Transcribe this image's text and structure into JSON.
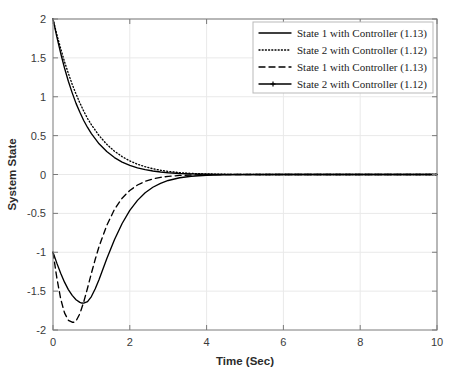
{
  "chart_data": {
    "type": "line",
    "title": "",
    "xlabel": "Time (Sec)",
    "ylabel": "System State",
    "xlim": [
      0,
      10
    ],
    "ylim": [
      -2,
      2
    ],
    "xticks": [
      0,
      2,
      4,
      6,
      8,
      10
    ],
    "xtick_labels": [
      "0",
      "2",
      "4",
      "6",
      "8",
      "10"
    ],
    "yticks": [
      -2,
      -1.5,
      -1,
      -0.5,
      0,
      0.5,
      1,
      1.5,
      2
    ],
    "ytick_labels": [
      "-2",
      "-1.5",
      "-1",
      "-0.5",
      "0",
      "0.5",
      "1",
      "1.5",
      "2"
    ],
    "grid": true,
    "legend_position": "top-right",
    "series": [
      {
        "name": "State 1 with Controller (1.13)",
        "style": "solid",
        "color": "#000000",
        "x": [
          0,
          0.1,
          0.2,
          0.3,
          0.4,
          0.5,
          0.6,
          0.7,
          0.8,
          0.9,
          1.0,
          1.2,
          1.4,
          1.6,
          1.8,
          2.0,
          2.2,
          2.4,
          2.6,
          2.8,
          3.0,
          3.3,
          3.6,
          4.0,
          4.5,
          5.0,
          6.0,
          7.0,
          8.0,
          9.0,
          10.0
        ],
        "values": [
          2.0,
          1.77,
          1.56,
          1.37,
          1.2,
          1.05,
          0.915,
          0.8,
          0.695,
          0.605,
          0.525,
          0.395,
          0.295,
          0.218,
          0.16,
          0.118,
          0.086,
          0.062,
          0.045,
          0.032,
          0.023,
          0.013,
          0.0075,
          0.0035,
          0.0012,
          0.0004,
          0.0,
          0.0,
          0.0,
          0.0,
          0.0
        ]
      },
      {
        "name": "State 2 with Controller (1.12)",
        "style": "dotted",
        "color": "#000000",
        "x": [
          0,
          0.1,
          0.2,
          0.3,
          0.4,
          0.5,
          0.6,
          0.7,
          0.8,
          0.9,
          1.0,
          1.2,
          1.4,
          1.6,
          1.8,
          2.0,
          2.2,
          2.4,
          2.6,
          2.8,
          3.0,
          3.3,
          3.6,
          4.0,
          4.5,
          5.0,
          6.0,
          7.0,
          8.0,
          9.0,
          10.0
        ],
        "values": [
          2.0,
          1.8,
          1.62,
          1.45,
          1.3,
          1.16,
          1.035,
          0.92,
          0.815,
          0.72,
          0.64,
          0.5,
          0.388,
          0.3,
          0.23,
          0.175,
          0.132,
          0.1,
          0.074,
          0.055,
          0.04,
          0.024,
          0.014,
          0.007,
          0.0025,
          0.0009,
          0.0001,
          0.0,
          0.0,
          0.0,
          0.0
        ]
      },
      {
        "name": "State 1 with Controller (1.13)",
        "style": "dashed",
        "color": "#000000",
        "x": [
          0,
          0.1,
          0.2,
          0.3,
          0.4,
          0.5,
          0.55,
          0.6,
          0.7,
          0.8,
          0.9,
          1.0,
          1.1,
          1.2,
          1.4,
          1.6,
          1.8,
          2.0,
          2.2,
          2.4,
          2.6,
          2.8,
          3.0,
          3.3,
          3.6,
          4.0,
          4.5,
          5.0,
          6.0,
          7.0,
          8.0,
          9.0,
          10.0
        ],
        "values": [
          -1.0,
          -1.33,
          -1.6,
          -1.78,
          -1.875,
          -1.9,
          -1.9,
          -1.885,
          -1.79,
          -1.64,
          -1.46,
          -1.27,
          -1.09,
          -0.925,
          -0.655,
          -0.45,
          -0.305,
          -0.205,
          -0.135,
          -0.088,
          -0.057,
          -0.037,
          -0.024,
          -0.012,
          -0.006,
          -0.0025,
          -0.0008,
          -0.0002,
          0.0,
          0.0,
          0.0,
          0.0,
          0.0
        ]
      },
      {
        "name": "State 2 with Controller (1.12)",
        "style": "solid-marker",
        "color": "#000000",
        "x": [
          0,
          0.1,
          0.2,
          0.3,
          0.4,
          0.5,
          0.6,
          0.7,
          0.75,
          0.8,
          0.9,
          1.0,
          1.1,
          1.2,
          1.4,
          1.6,
          1.8,
          2.0,
          2.2,
          2.4,
          2.6,
          2.8,
          3.0,
          3.3,
          3.6,
          4.0,
          4.5,
          5.0,
          6.0,
          7.0,
          8.0,
          9.0,
          10.0
        ],
        "values": [
          -1.0,
          -1.14,
          -1.27,
          -1.385,
          -1.48,
          -1.555,
          -1.61,
          -1.645,
          -1.653,
          -1.655,
          -1.635,
          -1.57,
          -1.47,
          -1.35,
          -1.085,
          -0.84,
          -0.63,
          -0.462,
          -0.333,
          -0.235,
          -0.164,
          -0.113,
          -0.077,
          -0.042,
          -0.022,
          -0.0095,
          -0.003,
          -0.001,
          -0.0001,
          0.0,
          0.0,
          0.0,
          0.0
        ]
      }
    ],
    "legend_entries": [
      {
        "label": "State 1 with Controller (1.13)",
        "style": "solid"
      },
      {
        "label": "State 2 with Controller (1.12)",
        "style": "dotted"
      },
      {
        "label": "State 1 with Controller (1.13)",
        "style": "dashed"
      },
      {
        "label": "State 2 with Controller (1.12)",
        "style": "solid-marker"
      }
    ]
  },
  "colors": {
    "background": "#ffffff",
    "axis": "#7a7a7a",
    "grid": "#e9e9e9",
    "line": "#000000",
    "legend_border": "#b9b9b9"
  }
}
